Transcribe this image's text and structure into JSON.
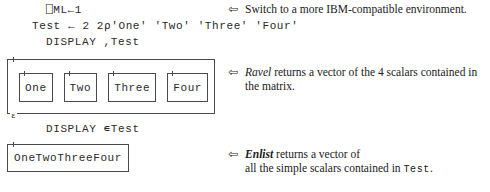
{
  "code": {
    "line_ml": "⎕ML←1",
    "line_assign": "Test ← 2 2⍴'One' 'Two' 'Three' 'Four'",
    "line_display_ravel": "DISPLAY ,Test",
    "line_display_enlist": "DISPLAY ∊Test"
  },
  "annotations": [
    {
      "arrow": "⇦",
      "lead": "",
      "text": "Switch to a more IBM-compatible environment."
    },
    {
      "arrow": "⇦",
      "lead": "Ravel",
      "text": " returns a vector of the 4 scalars contained in the matrix."
    },
    {
      "arrow": "⇦",
      "lead": "Enlist",
      "text_before": " returns a vector of\nall the simple scalars contained in ",
      "code_ref": "Test",
      "text_after": "."
    }
  ],
  "ravel_diagram": {
    "epsilon_marker": "ε",
    "cells": [
      {
        "label": "One"
      },
      {
        "label": "Two"
      },
      {
        "label": "Three"
      },
      {
        "label": "Four"
      }
    ]
  },
  "enlist_diagram": {
    "label": "OneTwoThreeFour"
  },
  "colors": {
    "ink": "#1a1a1a",
    "mono_ink": "#2a2a2a",
    "rule": "#4a4a4a",
    "background": "#ffffff"
  }
}
